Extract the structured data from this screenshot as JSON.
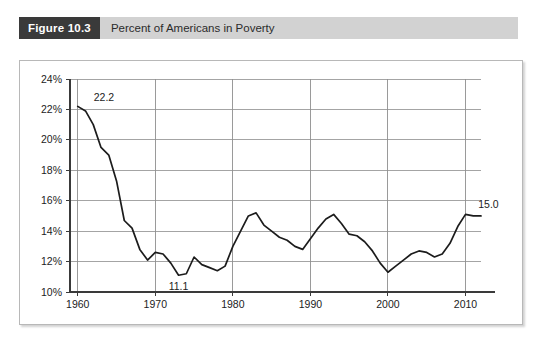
{
  "figure": {
    "badge": "Figure 10.3",
    "caption": "Percent of Americans in Poverty",
    "badge_bg": "#3a3a3a",
    "bar_bg": "#d2d2d2"
  },
  "chart_data": {
    "type": "line",
    "title": "Percent of Americans in Poverty",
    "xlabel": "",
    "ylabel": "",
    "xlim": [
      1959,
      2012
    ],
    "ylim": [
      10,
      24
    ],
    "grid": true,
    "legend": null,
    "line_color": "#1c1c1c",
    "ytick_labels": [
      "10%",
      "12%",
      "14%",
      "16%",
      "18%",
      "20%",
      "22%",
      "24%"
    ],
    "ytick_values": [
      10,
      12,
      14,
      16,
      18,
      20,
      22,
      24
    ],
    "xtick_labels": [
      "1960",
      "1970",
      "1980",
      "1990",
      "2000",
      "2010"
    ],
    "xtick_values": [
      1960,
      1970,
      1980,
      1990,
      2000,
      2010
    ],
    "annotations": [
      {
        "text": "22.2",
        "x": 1960,
        "y": 22.2
      },
      {
        "text": "11.1",
        "x": 1973,
        "y": 11.1
      },
      {
        "text": "15.0",
        "x": 2011,
        "y": 15.0
      }
    ],
    "x": [
      1960,
      1961,
      1962,
      1963,
      1964,
      1965,
      1966,
      1967,
      1968,
      1969,
      1970,
      1971,
      1972,
      1973,
      1974,
      1975,
      1976,
      1977,
      1978,
      1979,
      1980,
      1981,
      1982,
      1983,
      1984,
      1985,
      1986,
      1987,
      1988,
      1989,
      1990,
      1991,
      1992,
      1993,
      1994,
      1995,
      1996,
      1997,
      1998,
      1999,
      2000,
      2001,
      2002,
      2003,
      2004,
      2005,
      2006,
      2007,
      2008,
      2009,
      2010,
      2011,
      2012
    ],
    "values": [
      22.2,
      21.9,
      21.0,
      19.5,
      19.0,
      17.3,
      14.7,
      14.2,
      12.8,
      12.1,
      12.6,
      12.5,
      11.9,
      11.1,
      11.2,
      12.3,
      11.8,
      11.6,
      11.4,
      11.7,
      13.0,
      14.0,
      15.0,
      15.2,
      14.4,
      14.0,
      13.6,
      13.4,
      13.0,
      12.8,
      13.5,
      14.2,
      14.8,
      15.1,
      14.5,
      13.8,
      13.7,
      13.3,
      12.7,
      11.9,
      11.3,
      11.7,
      12.1,
      12.5,
      12.7,
      12.6,
      12.3,
      12.5,
      13.2,
      14.3,
      15.1,
      15.0,
      15.0
    ]
  }
}
